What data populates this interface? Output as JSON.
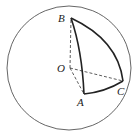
{
  "diagram": {
    "points": {
      "B": {
        "label": "B"
      },
      "O": {
        "label": "O"
      },
      "A": {
        "label": "A"
      },
      "C": {
        "label": "C"
      }
    },
    "solid_arcs": [
      "BA",
      "BC",
      "AC"
    ],
    "dashed_segments": [
      "OB",
      "OA",
      "OC"
    ],
    "colors": {
      "stroke": "#222222",
      "circle": "#555555"
    }
  }
}
